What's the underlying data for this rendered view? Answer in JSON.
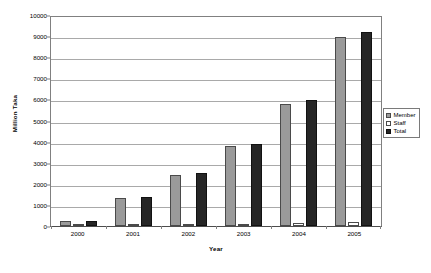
{
  "chart_data": {
    "type": "bar",
    "title": "",
    "xlabel": "Year",
    "ylabel": "Million Taka",
    "categories": [
      "2000",
      "2001",
      "2002",
      "2003",
      "2004",
      "2005"
    ],
    "series": [
      {
        "name": "Member",
        "color": "#9a9a9a",
        "values": [
          250,
          1330,
          2430,
          3800,
          5800,
          8980
        ]
      },
      {
        "name": "Staff",
        "color": "#ffffff",
        "values": [
          10,
          30,
          80,
          110,
          150,
          180
        ]
      },
      {
        "name": "Total",
        "color": "#262626",
        "values": [
          260,
          1370,
          2520,
          3900,
          5980,
          9180
        ]
      }
    ],
    "ylim": [
      0,
      10000
    ],
    "ytick_step": 1000,
    "yticks": [
      "10000",
      "9000",
      "8000",
      "7000",
      "6000",
      "5000",
      "4000",
      "3000",
      "2000",
      "1000",
      "0"
    ],
    "grid": true,
    "legend_position": "right"
  }
}
